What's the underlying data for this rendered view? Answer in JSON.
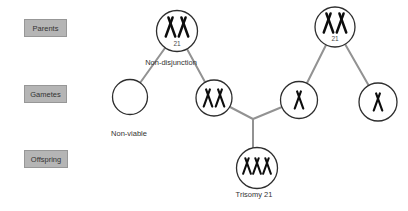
{
  "colors": {
    "background": "#ffffff",
    "box_bg": "#b5b5b5",
    "box_border": "#979797",
    "line": "#929292",
    "circle_stroke": "#2e2e2e",
    "chromosome": "#0d0d0d",
    "text": "#333333",
    "subtext": "#4a4a4a"
  },
  "labels": {
    "parents": "Parents",
    "gametes": "Gametes",
    "offspring": "Offspring",
    "non_disjunction": "Non-disjunction",
    "non_viable": "Non-viable",
    "trisomy_21": "Trisomy 21",
    "parent_left_chromosome": "21",
    "parent_right_chromosome": "21"
  },
  "nodes": [
    {
      "id": "parent-left",
      "stage": "Parents",
      "chromosome_21_count": 2,
      "label": "21"
    },
    {
      "id": "parent-right",
      "stage": "Parents",
      "chromosome_21_count": 2,
      "label": "21"
    },
    {
      "id": "gamete-empty",
      "stage": "Gametes",
      "chromosome_21_count": 0,
      "label": "Non-viable"
    },
    {
      "id": "gamete-disomic",
      "stage": "Gametes",
      "chromosome_21_count": 2,
      "label": ""
    },
    {
      "id": "gamete-monosomic-left",
      "stage": "Gametes",
      "chromosome_21_count": 1,
      "label": ""
    },
    {
      "id": "gamete-monosomic-right",
      "stage": "Gametes",
      "chromosome_21_count": 1,
      "label": ""
    },
    {
      "id": "offspring-trisomy",
      "stage": "Offspring",
      "chromosome_21_count": 3,
      "label": "Trisomy 21"
    }
  ],
  "edges": [
    {
      "from": "parent-left",
      "to": "gamete-empty",
      "note": "non-disjunction"
    },
    {
      "from": "parent-left",
      "to": "gamete-disomic",
      "note": "non-disjunction"
    },
    {
      "from": "parent-right",
      "to": "gamete-monosomic-left"
    },
    {
      "from": "parent-right",
      "to": "gamete-monosomic-right"
    },
    {
      "from": "gamete-disomic",
      "to": "offspring-trisomy"
    },
    {
      "from": "gamete-monosomic-left",
      "to": "offspring-trisomy"
    }
  ]
}
